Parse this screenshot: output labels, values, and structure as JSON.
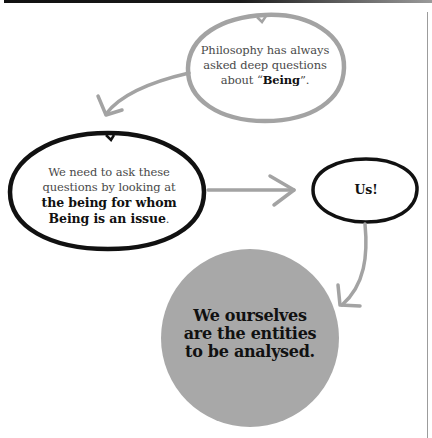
{
  "diagram": {
    "nodes": [
      {
        "id": "philosophy",
        "style": "gray-outline-bubble",
        "text_pre": "Philosophy has always asked deep questions about “",
        "text_bold": "Being",
        "text_post": "”."
      },
      {
        "id": "ask-questions",
        "style": "black-outline-bubble",
        "text_pre": "We need to ask these questions by looking at",
        "text_bold": "the being for whom Being is an issue",
        "text_post": "."
      },
      {
        "id": "us",
        "style": "black-outline-bubble",
        "text": "Us!"
      },
      {
        "id": "entities",
        "style": "gray-filled-circle",
        "text": "We ourselves are the entities to be analysed."
      }
    ],
    "edges": [
      {
        "from": "philosophy",
        "to": "ask-questions"
      },
      {
        "from": "ask-questions",
        "to": "us"
      },
      {
        "from": "us",
        "to": "entities"
      }
    ],
    "colors": {
      "gray_stroke": "#a3a3a3",
      "black_stroke": "#111111",
      "circle_fill": "#a8a8a8",
      "body_text": "#4a4a4a",
      "bold_text": "#111111"
    }
  }
}
